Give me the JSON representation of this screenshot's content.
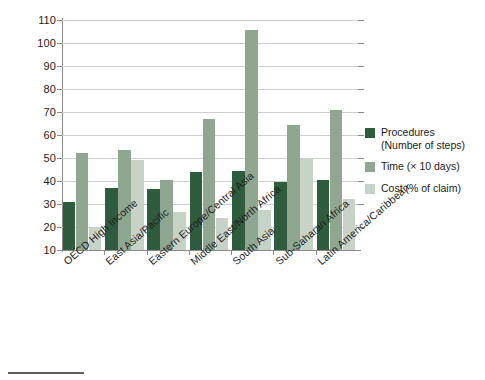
{
  "chart_data": {
    "type": "bar",
    "title": "",
    "subtitle": "",
    "xlabel": "",
    "ylabel": "",
    "ylim": [
      10,
      110
    ],
    "ytick_step": 10,
    "yticks": [
      10,
      20,
      30,
      40,
      50,
      60,
      70,
      80,
      90,
      100,
      110
    ],
    "ytick_labels": [
      "10",
      "20",
      "30",
      "40",
      "50",
      "60",
      "70",
      "80",
      "90",
      "100",
      "110"
    ],
    "grid": true,
    "grid_axis": "y",
    "legend_position": "right",
    "categories": [
      "OECD High Income",
      "East Asia/Pacific",
      "Eastern Europe/Central Asia",
      "Middle East/North Africa",
      "South Asia",
      "Sub-Saharan Africa",
      "Latin America/Caribbean"
    ],
    "series": [
      {
        "name": "Procedures",
        "name_line2": "(Number of steps)",
        "color": "#2f5b3e",
        "values": [
          31,
          37,
          36.5,
          44,
          44.5,
          39.5,
          40.5
        ]
      },
      {
        "name": "Time (× 10 days)",
        "name_line2": "",
        "color": "#8fa791",
        "values": [
          52,
          53.5,
          40.5,
          67,
          105.5,
          64.5,
          71
        ]
      },
      {
        "name": "Cost (% of claim)",
        "name_line2": "",
        "color": "#c7d3c6",
        "values": [
          20,
          49,
          26.5,
          24,
          27.5,
          50,
          32
        ]
      }
    ]
  },
  "legend": {
    "items": [
      {
        "label": "Procedures",
        "label2": "(Number of steps)",
        "swatch": "#2f5b3e"
      },
      {
        "label": "Time (× 10 days)",
        "label2": "",
        "swatch": "#8fa791"
      },
      {
        "label": "Cost (% of claim)",
        "label2": "",
        "swatch": "#c7d3c6"
      }
    ]
  },
  "colors": {
    "procedures": "#2f5b3e",
    "time": "#8fa791",
    "cost": "#c7d3c6",
    "axis": "#8a8a8a",
    "grid": "#cfcfcf",
    "text": "#1a1a1a"
  }
}
